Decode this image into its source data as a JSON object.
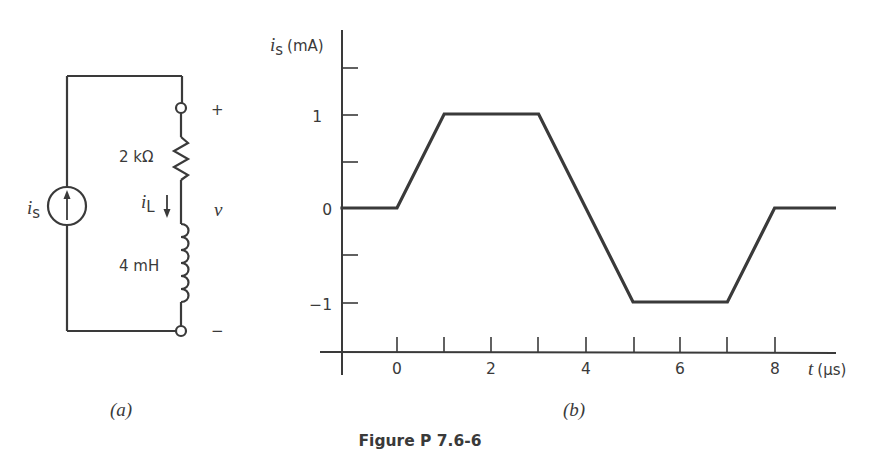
{
  "figure": {
    "caption": "Figure P 7.6-6",
    "panel_a_label": "(a)",
    "panel_b_label": "(b)"
  },
  "circuit": {
    "source_label": "i",
    "source_subscript": "s",
    "resistor_label": "2 kΩ",
    "inductor_label": "4 mH",
    "current_label": "i",
    "current_subscript": "L",
    "voltage_label": "v",
    "plus_sign": "+",
    "minus_sign": "−"
  },
  "chart_data": {
    "type": "line",
    "title": "",
    "xlabel": "t (µs)",
    "ylabel": "is (mA)",
    "ylabel_main": "i",
    "ylabel_sub": "s",
    "ylabel_unit": "(mA)",
    "xlabel_main": "t",
    "xlabel_unit": "(µs)",
    "x_tick_labels": [
      "0",
      "2",
      "4",
      "6",
      "8"
    ],
    "y_tick_labels": [
      "1",
      "0",
      "−1"
    ],
    "x_ticks": [
      0,
      1,
      2,
      3,
      4,
      5,
      6,
      7,
      8
    ],
    "y_ticks": [
      1.5,
      1,
      0.5,
      0,
      -0.5,
      -1
    ],
    "xlim": [
      -1.2,
      9.3
    ],
    "ylim": [
      -1.5,
      1.9
    ],
    "grid": false,
    "series": [
      {
        "name": "is",
        "x": [
          -1.2,
          0,
          1,
          3,
          5,
          7,
          8,
          9.3
        ],
        "y": [
          0,
          0,
          1,
          1,
          -1,
          -1,
          0,
          0
        ]
      }
    ]
  }
}
